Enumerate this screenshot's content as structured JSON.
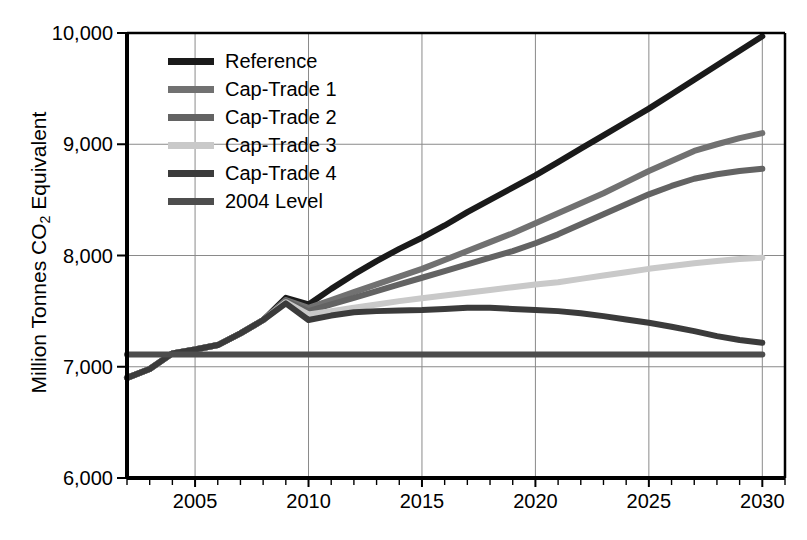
{
  "chart_data": {
    "type": "line",
    "title": "",
    "xlabel": "",
    "ylabel": "Million Tonnes CO2 Equivalent",
    "ylabel_prefix": "Million Tonnes CO",
    "ylabel_sub": "2",
    "ylabel_suffix": " Equivalent",
    "xlim": [
      2002,
      2031
    ],
    "ylim": [
      6000,
      10000
    ],
    "grid": true,
    "legend_position": "upper-left-inside",
    "y_ticks": [
      6000,
      7000,
      8000,
      9000,
      10000
    ],
    "y_tick_labels": [
      "6,000",
      "7,000",
      "8,000",
      "9,000",
      "10,000"
    ],
    "x_ticks": [
      2005,
      2010,
      2015,
      2020,
      2025,
      2030
    ],
    "x_tick_labels": [
      "2005",
      "2010",
      "2015",
      "2020",
      "2025",
      "2030"
    ],
    "x_minor_tick_step": 1,
    "x": [
      2002,
      2003,
      2004,
      2005,
      2006,
      2007,
      2008,
      2009,
      2010,
      2011,
      2012,
      2013,
      2014,
      2015,
      2016,
      2017,
      2018,
      2019,
      2020,
      2021,
      2022,
      2023,
      2024,
      2025,
      2026,
      2027,
      2028,
      2029,
      2030
    ],
    "series": [
      {
        "name": "Reference",
        "color": "#1a1a1a",
        "width": 6,
        "values": [
          6900,
          6980,
          7120,
          7155,
          7195,
          7300,
          7420,
          7620,
          7560,
          7700,
          7830,
          7950,
          8060,
          8160,
          8270,
          8390,
          8500,
          8610,
          8720,
          8840,
          8960,
          9080,
          9200,
          9320,
          9450,
          9580,
          9710,
          9840,
          9970
        ]
      },
      {
        "name": "Cap-Trade 1",
        "color": "#717171",
        "width": 6,
        "values": [
          6900,
          6980,
          7120,
          7155,
          7195,
          7300,
          7420,
          7600,
          7530,
          7600,
          7670,
          7740,
          7810,
          7880,
          7960,
          8040,
          8120,
          8200,
          8290,
          8380,
          8470,
          8560,
          8660,
          8760,
          8850,
          8940,
          9000,
          9055,
          9100
        ]
      },
      {
        "name": "Cap-Trade 2",
        "color": "#636363",
        "width": 6,
        "values": [
          6900,
          6980,
          7120,
          7155,
          7195,
          7300,
          7420,
          7590,
          7500,
          7560,
          7620,
          7680,
          7740,
          7800,
          7860,
          7920,
          7980,
          8040,
          8110,
          8190,
          8280,
          8370,
          8460,
          8550,
          8625,
          8690,
          8730,
          8760,
          8780
        ]
      },
      {
        "name": "Cap-Trade 3",
        "color": "#c9c9c9",
        "width": 6,
        "values": [
          6900,
          6980,
          7120,
          7155,
          7195,
          7300,
          7420,
          7580,
          7470,
          7500,
          7530,
          7560,
          7590,
          7615,
          7640,
          7665,
          7690,
          7715,
          7740,
          7760,
          7790,
          7820,
          7850,
          7880,
          7905,
          7930,
          7950,
          7968,
          7980
        ]
      },
      {
        "name": "Cap-Trade 4",
        "color": "#3b3b3b",
        "width": 6,
        "values": [
          6900,
          6980,
          7120,
          7155,
          7195,
          7300,
          7420,
          7570,
          7420,
          7460,
          7490,
          7500,
          7505,
          7510,
          7520,
          7530,
          7530,
          7520,
          7510,
          7500,
          7480,
          7455,
          7425,
          7395,
          7360,
          7320,
          7275,
          7240,
          7215
        ]
      },
      {
        "name": "2004 Level",
        "color": "#4d4d4d",
        "width": 6,
        "constant": 7110,
        "values": [
          7110,
          7110,
          7110,
          7110,
          7110,
          7110,
          7110,
          7110,
          7110,
          7110,
          7110,
          7110,
          7110,
          7110,
          7110,
          7110,
          7110,
          7110,
          7110,
          7110,
          7110,
          7110,
          7110,
          7110,
          7110,
          7110,
          7110,
          7110,
          7110
        ]
      }
    ]
  },
  "legend": {
    "items": [
      {
        "label": "Reference",
        "color": "#1a1a1a"
      },
      {
        "label": "Cap-Trade 1",
        "color": "#717171"
      },
      {
        "label": "Cap-Trade 2",
        "color": "#636363"
      },
      {
        "label": "Cap-Trade 3",
        "color": "#c9c9c9"
      },
      {
        "label": "Cap-Trade 4",
        "color": "#3b3b3b"
      },
      {
        "label": "2004 Level",
        "color": "#4d4d4d"
      }
    ]
  },
  "axis": {
    "y_label_text": "Million Tonnes CO",
    "y_label_sub": "2",
    "y_label_tail": " Equivalent"
  }
}
